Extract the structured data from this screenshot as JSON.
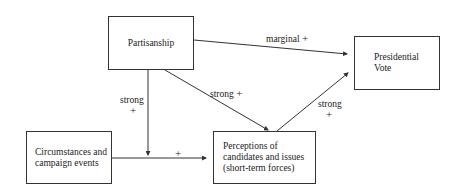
{
  "nodes": {
    "partisanship": {
      "label": "Partisanship"
    },
    "presidential_vote": {
      "lines": [
        "Presidential",
        "Vote"
      ]
    },
    "circumstances": {
      "lines": [
        "Circumstances and",
        "campaign events"
      ]
    },
    "perceptions": {
      "lines": [
        "Perceptions of",
        "candidates and issues",
        "(short-term forces)"
      ]
    }
  },
  "edges": {
    "partisanship_to_vote": {
      "strength": "marginal",
      "sign": "+"
    },
    "partisanship_to_perceptions": {
      "strength": "strong",
      "sign": "+"
    },
    "partisanship_to_circumstances_path": {
      "strength": "strong",
      "sign": "+"
    },
    "circumstances_to_perceptions": {
      "strength": "",
      "sign": "+"
    },
    "perceptions_to_vote": {
      "strength": "strong",
      "sign": "+"
    }
  },
  "colors": {
    "line": "#333333",
    "text": "#222222",
    "background": "#ffffff"
  }
}
